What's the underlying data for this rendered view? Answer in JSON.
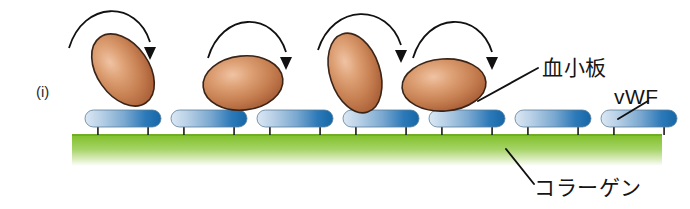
{
  "figure": {
    "panel_label": "(i)",
    "width": 690,
    "height": 209,
    "background": "#ffffff"
  },
  "labels": {
    "platelet": "血小板",
    "vwf": "vWF",
    "collagen": "コラーゲン"
  },
  "colors": {
    "platelet_fill_light": "#e8b394",
    "platelet_fill_mid": "#c87d52",
    "platelet_fill_dark": "#a85c38",
    "platelet_outline": "#3a2418",
    "vwf_light": "#cfe0f0",
    "vwf_mid": "#6d9fca",
    "vwf_dark": "#1a6aad",
    "vwf_outline": "#4b6b86",
    "collagen_top": "#7ebf2a",
    "collagen_mid": "#9ccf4e",
    "collagen_bottom": "#ffffff",
    "stem": "#1a1a1a",
    "arrow": "#111111",
    "leader": "#111111",
    "text": "#151515"
  },
  "scene": {
    "platelets": [
      {
        "name": "platelet-1",
        "cx": 123,
        "cy": 70,
        "rx": 26,
        "ry": 40,
        "rotate": -35
      },
      {
        "name": "platelet-2",
        "cx": 243,
        "cy": 83,
        "rx": 40,
        "ry": 27,
        "rotate": -6
      },
      {
        "name": "platelet-3",
        "cx": 355,
        "cy": 73,
        "rx": 25,
        "ry": 41,
        "rotate": -18
      },
      {
        "name": "platelet-4",
        "cx": 444,
        "cy": 85,
        "rx": 42,
        "ry": 26,
        "rotate": -4
      }
    ],
    "arrows": [
      {
        "name": "rolling-arrow-1",
        "x1": 69,
        "y1": 48,
        "x2": 150,
        "y2": 22,
        "x3": 150,
        "y3": 52
      },
      {
        "name": "rolling-arrow-2",
        "x1": 208,
        "y1": 58,
        "x2": 286,
        "y2": 33,
        "x3": 286,
        "y3": 62
      },
      {
        "name": "rolling-arrow-3",
        "x1": 318,
        "y1": 50,
        "x2": 401,
        "y2": 25,
        "x3": 401,
        "y3": 55
      },
      {
        "name": "rolling-arrow-4",
        "x1": 413,
        "y1": 58,
        "x2": 492,
        "y2": 33,
        "x3": 492,
        "y3": 62
      }
    ],
    "vwf_bars": [
      {
        "name": "vwf-bar-1",
        "x": 85,
        "y": 110,
        "w": 76,
        "h": 17
      },
      {
        "name": "vwf-bar-2",
        "x": 171,
        "y": 110,
        "w": 76,
        "h": 17
      },
      {
        "name": "vwf-bar-3",
        "x": 257,
        "y": 110,
        "w": 76,
        "h": 17
      },
      {
        "name": "vwf-bar-4",
        "x": 343,
        "y": 110,
        "w": 76,
        "h": 17
      },
      {
        "name": "vwf-bar-5",
        "x": 429,
        "y": 110,
        "w": 76,
        "h": 17
      },
      {
        "name": "vwf-bar-6",
        "x": 515,
        "y": 110,
        "w": 76,
        "h": 17
      },
      {
        "name": "vwf-bar-7",
        "x": 601,
        "y": 110,
        "w": 76,
        "h": 17
      }
    ],
    "collagen": {
      "name": "collagen-band",
      "x": 72,
      "y": 134,
      "w": 590,
      "h": 32
    },
    "leader_lines": [
      {
        "name": "leader-platelet",
        "x1": 478,
        "y1": 101,
        "x2": 538,
        "y2": 68
      },
      {
        "name": "leader-vwf",
        "x1": 618,
        "y1": 119,
        "x2": 648,
        "y2": 101
      },
      {
        "name": "leader-collagen",
        "x1": 506,
        "y1": 149,
        "x2": 534,
        "y2": 184
      }
    ]
  }
}
